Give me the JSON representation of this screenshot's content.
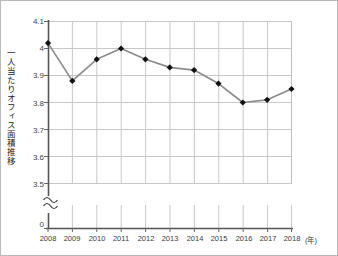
{
  "chart_data": {
    "type": "line",
    "title": "",
    "ylabel": "一人当たりオフィス面積推移",
    "xlabel": "(年)",
    "categories": [
      "2008",
      "2009",
      "2010",
      "2011",
      "2012",
      "2013",
      "2014",
      "2015",
      "2016",
      "2017",
      "2018"
    ],
    "values": [
      4.02,
      3.88,
      3.96,
      4.0,
      3.96,
      3.93,
      3.92,
      3.87,
      3.8,
      3.81,
      3.85
    ],
    "series": [
      {
        "name": "一人当たりオフィス面積推移",
        "values": [
          4.02,
          3.88,
          3.96,
          4.0,
          3.96,
          3.93,
          3.92,
          3.87,
          3.8,
          3.81,
          3.85
        ]
      }
    ],
    "ylim": [
      3.5,
      4.1
    ],
    "yticks": [
      "3.5",
      "3.6",
      "3.7",
      "3.8",
      "3.9",
      "4",
      "4.1"
    ],
    "ytick_values": [
      3.5,
      3.6,
      3.7,
      3.8,
      3.9,
      4.0,
      4.1
    ],
    "axis_break": true,
    "axis_break_symbol": "≈",
    "zero_label": "0",
    "grid": true,
    "legend": "none",
    "line_color": "#8c8c8c",
    "marker_color": "#111111",
    "marker_shape": "diamond",
    "grid_color": "#c8c8c8",
    "axis_color": "#555555",
    "border_color": "#b0b0b0"
  }
}
